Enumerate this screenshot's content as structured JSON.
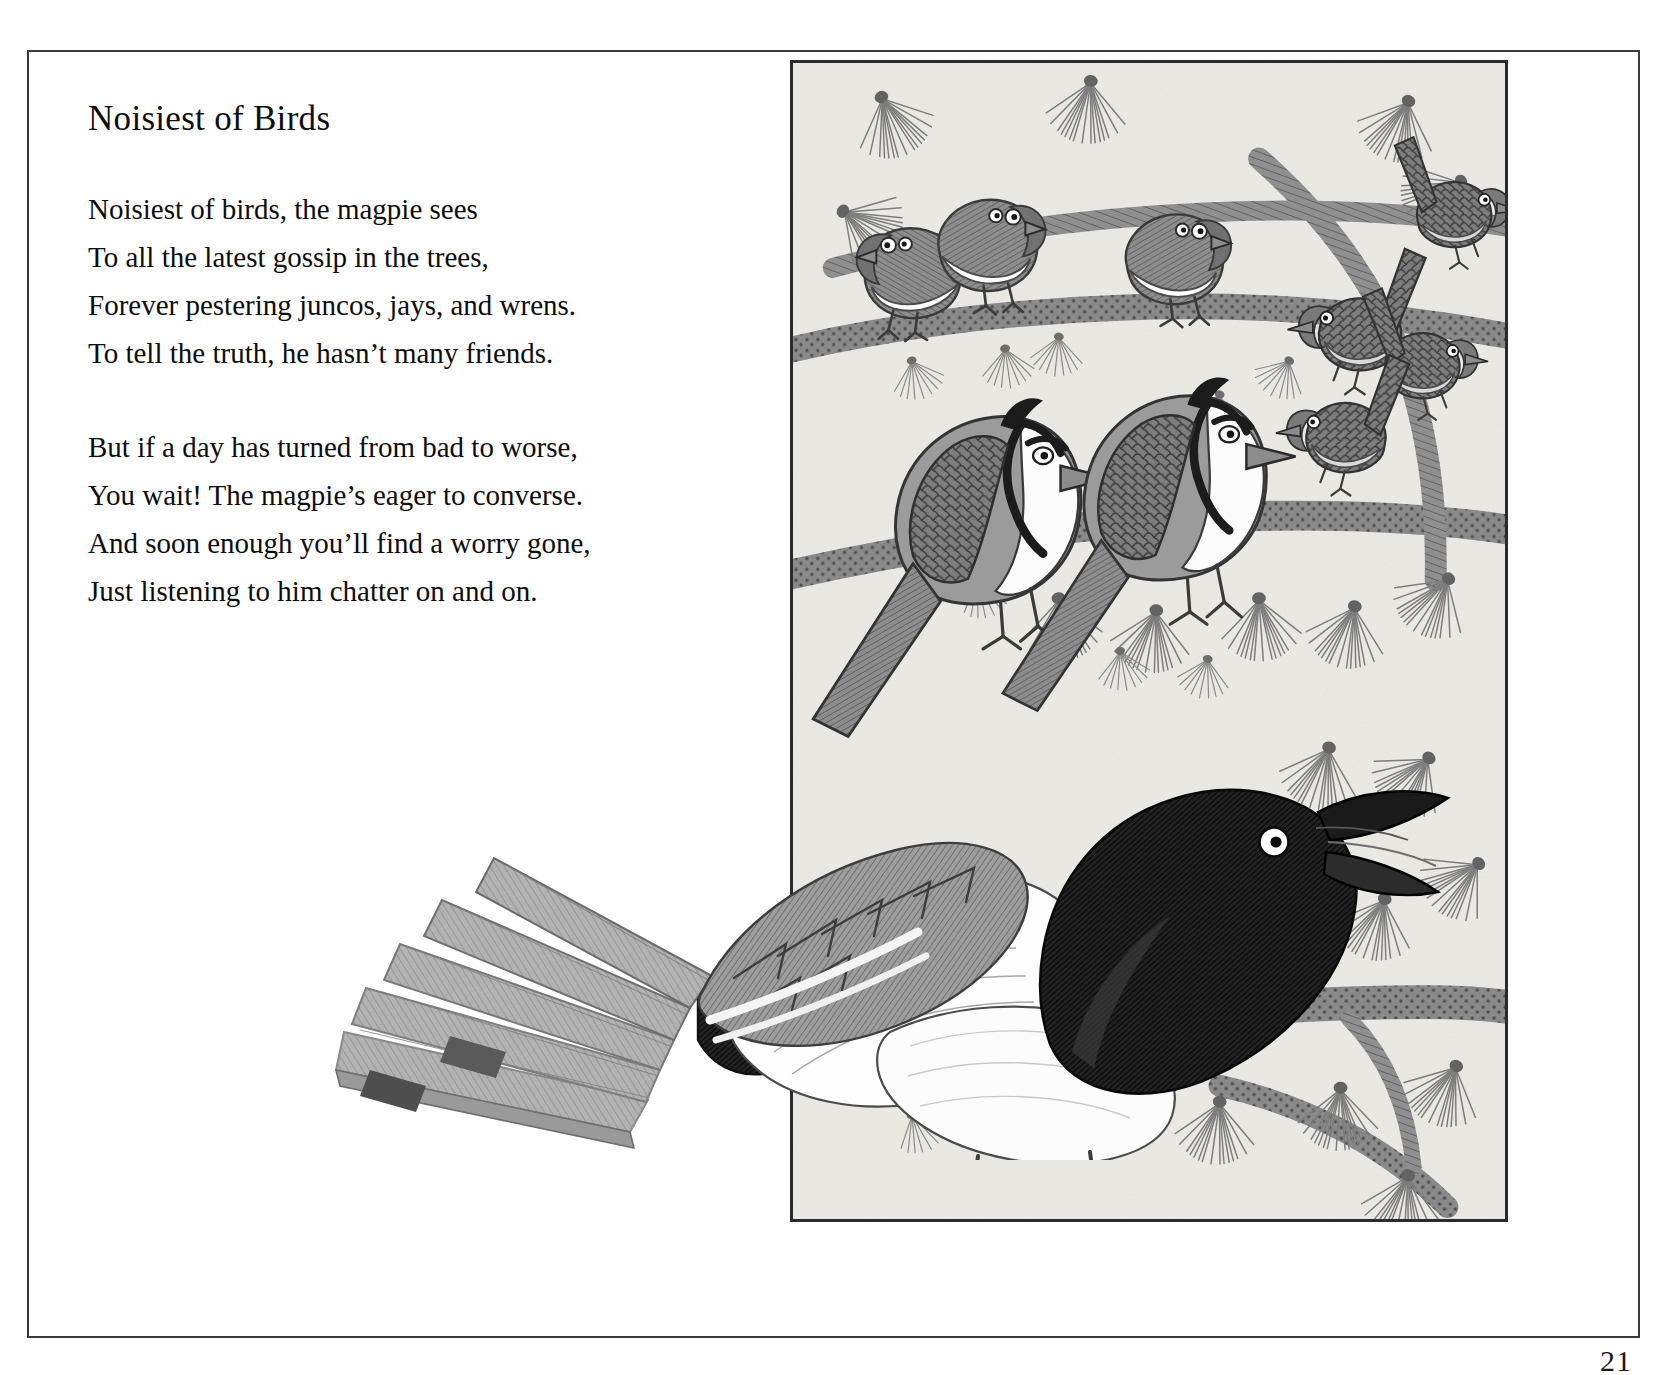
{
  "page": {
    "number": "21",
    "background_color": "#ffffff",
    "frame_color": "#3a3a3a"
  },
  "poem": {
    "title": "Noisiest of Birds",
    "stanzas": [
      {
        "lines": [
          "Noisiest of birds, the magpie sees",
          "To all the latest gossip in the trees,",
          "Forever pestering juncos, jays, and wrens.",
          "To tell the truth, he hasn’t many friends."
        ]
      },
      {
        "lines": [
          "But if a day has turned from bad to worse,",
          "You wait! The magpie’s eager to converse.",
          "And soon enough you’ll find a worry gone,",
          "Just listening to him chatter on and on."
        ]
      }
    ]
  },
  "illustration": {
    "caption": "",
    "paper_color": "#eceae4",
    "ink_color": "#4a4a4a",
    "dark_ink_color": "#1e1e1e",
    "frame_color": "#2b2b2b",
    "subjects": [
      "junco-upper-left",
      "junco-upper-middle",
      "junco-upper-right",
      "wren-top-right",
      "wren-middle-right",
      "wren-lower-right",
      "jay-left",
      "jay-right",
      "magpie-foreground"
    ]
  }
}
